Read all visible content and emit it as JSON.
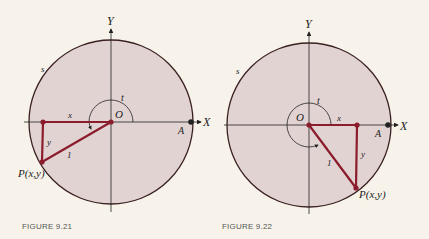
{
  "figures": [
    {
      "caption": "FIGURE 9.21",
      "labels": {
        "y_axis": "Y",
        "x_axis": "X",
        "origin": "O",
        "point_a": "A",
        "arc": "s",
        "angle": "t",
        "x_leg": "x",
        "y_leg": "y",
        "hypotenuse": "1",
        "point_p": "P(x,y)"
      }
    },
    {
      "caption": "FIGURE 9.22",
      "labels": {
        "y_axis": "Y",
        "x_axis": "X",
        "origin": "O",
        "point_a": "A",
        "arc": "s",
        "angle": "t",
        "x_leg": "x",
        "y_leg": "y",
        "hypotenuse": "1",
        "point_p": "P(x,y)"
      }
    }
  ],
  "colors": {
    "disc_fill": "#e2d3d3",
    "circle_stroke": "#3a2020",
    "triangle": "#8b1c2c",
    "axis": "#222222",
    "background": "#f7f3ea"
  }
}
